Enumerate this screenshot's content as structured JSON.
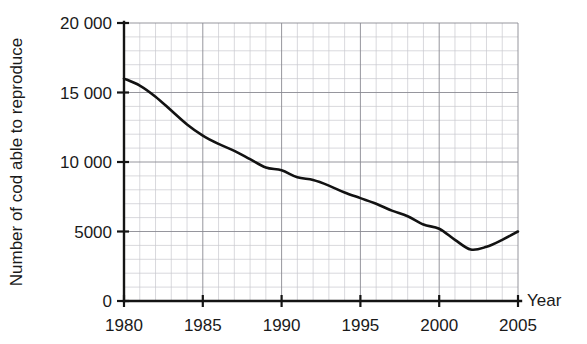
{
  "chart_data": {
    "type": "line",
    "title": "",
    "xlabel": "Year",
    "ylabel": "Number of cod able to reproduce",
    "xlim": [
      1980,
      2005
    ],
    "ylim": [
      0,
      20000
    ],
    "grid": true,
    "legend": null,
    "x_major_ticks": [
      1980,
      1985,
      1990,
      1995,
      2000,
      2005
    ],
    "x_major_tick_labels": [
      "1980",
      "1985",
      "1990",
      "1995",
      "2000",
      "2005"
    ],
    "x_minor_tick_step": 1,
    "y_major_ticks": [
      0,
      5000,
      10000,
      15000,
      20000
    ],
    "y_major_tick_labels": [
      "0",
      "5000",
      "10 000",
      "15 000",
      "20 000"
    ],
    "y_minor_tick_step": 1000,
    "line_color": "#121212",
    "grid_minor_color": "#c9c9cf",
    "grid_major_color": "#8a8a92",
    "axis_color": "#141414",
    "series": [
      {
        "name": "Number of cod able to reproduce",
        "x": [
          1980,
          1981,
          1982,
          1983,
          1984,
          1985,
          1986,
          1987,
          1988,
          1989,
          1990,
          1991,
          1992,
          1993,
          1994,
          1995,
          1996,
          1997,
          1998,
          1999,
          2000,
          2001,
          2002,
          2003,
          2004,
          2005
        ],
        "values": [
          16000,
          15500,
          14700,
          13700,
          12700,
          11900,
          11300,
          10800,
          10200,
          9600,
          9400,
          8900,
          8700,
          8300,
          7800,
          7400,
          7000,
          6500,
          6100,
          5500,
          5200,
          4400,
          3700,
          3900,
          4400,
          5000
        ]
      }
    ]
  }
}
